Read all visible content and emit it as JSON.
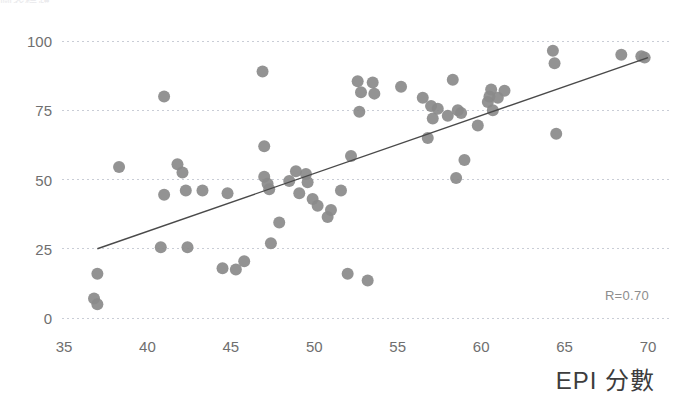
{
  "chart_data": {
    "type": "scatter",
    "title": "",
    "xlabel": "EPI 分數",
    "ylabel": "",
    "xlim": [
      35,
      70
    ],
    "ylim": [
      0,
      100
    ],
    "xticks": [
      35,
      40,
      45,
      50,
      55,
      60,
      65,
      70
    ],
    "yticks": [
      0,
      25,
      50,
      75,
      100
    ],
    "grid": "horizontal-dashed",
    "legend": "none",
    "annotations": [
      {
        "text": "R=0.70",
        "x": 67.5,
        "y": 11
      }
    ],
    "trendline": {
      "type": "linear",
      "x_start": 37.0,
      "y_start": 25.0,
      "x_end": 70.0,
      "y_end": 94.0,
      "color": "#4a4a4a"
    },
    "marker": {
      "shape": "circle",
      "color": "#8a8a8a",
      "radius_px": 6
    },
    "points": [
      [
        36.8,
        7.0
      ],
      [
        37.0,
        5.0
      ],
      [
        37.0,
        16.0
      ],
      [
        38.3,
        54.5
      ],
      [
        40.8,
        25.5
      ],
      [
        41.0,
        80.0
      ],
      [
        41.0,
        44.5
      ],
      [
        41.8,
        55.5
      ],
      [
        42.1,
        52.5
      ],
      [
        42.3,
        46.0
      ],
      [
        42.4,
        25.5
      ],
      [
        43.3,
        46.0
      ],
      [
        44.5,
        18.0
      ],
      [
        44.8,
        45.0
      ],
      [
        45.3,
        17.5
      ],
      [
        45.8,
        20.5
      ],
      [
        46.9,
        89.0
      ],
      [
        47.0,
        62.0
      ],
      [
        47.0,
        51.0
      ],
      [
        47.2,
        48.5
      ],
      [
        47.3,
        46.5
      ],
      [
        47.4,
        27.0
      ],
      [
        47.9,
        34.5
      ],
      [
        48.5,
        49.5
      ],
      [
        48.9,
        53.0
      ],
      [
        49.1,
        45.0
      ],
      [
        49.5,
        52.0
      ],
      [
        49.6,
        49.0
      ],
      [
        49.9,
        43.0
      ],
      [
        50.2,
        40.5
      ],
      [
        50.8,
        36.5
      ],
      [
        51.0,
        39.0
      ],
      [
        51.6,
        46.0
      ],
      [
        52.0,
        16.0
      ],
      [
        52.2,
        58.5
      ],
      [
        52.6,
        85.5
      ],
      [
        52.7,
        74.5
      ],
      [
        52.8,
        81.5
      ],
      [
        53.2,
        13.5
      ],
      [
        53.5,
        85.0
      ],
      [
        53.6,
        81.0
      ],
      [
        55.2,
        83.5
      ],
      [
        56.5,
        79.5
      ],
      [
        56.8,
        65.0
      ],
      [
        57.0,
        76.5
      ],
      [
        57.1,
        72.0
      ],
      [
        57.4,
        75.5
      ],
      [
        58.0,
        73.0
      ],
      [
        58.3,
        86.0
      ],
      [
        58.5,
        50.5
      ],
      [
        58.6,
        75.0
      ],
      [
        58.8,
        74.0
      ],
      [
        59.0,
        57.0
      ],
      [
        59.8,
        69.5
      ],
      [
        60.4,
        78.0
      ],
      [
        60.5,
        80.0
      ],
      [
        60.6,
        82.5
      ],
      [
        60.7,
        75.0
      ],
      [
        61.0,
        79.5
      ],
      [
        61.4,
        82.0
      ],
      [
        64.3,
        96.5
      ],
      [
        64.4,
        92.0
      ],
      [
        64.5,
        66.5
      ],
      [
        68.4,
        95.0
      ],
      [
        69.6,
        94.5
      ],
      [
        69.8,
        94.0
      ]
    ]
  },
  "axis": {
    "x_title": "EPI 分數",
    "x_tick_labels": [
      "35",
      "40",
      "45",
      "50",
      "55",
      "60",
      "65",
      "70"
    ],
    "y_tick_labels": [
      "100",
      "75",
      "50",
      "25",
      "0"
    ]
  },
  "annotation": {
    "correlation": "R=0.70"
  },
  "header": {
    "clipped_title": "圖表標題"
  }
}
